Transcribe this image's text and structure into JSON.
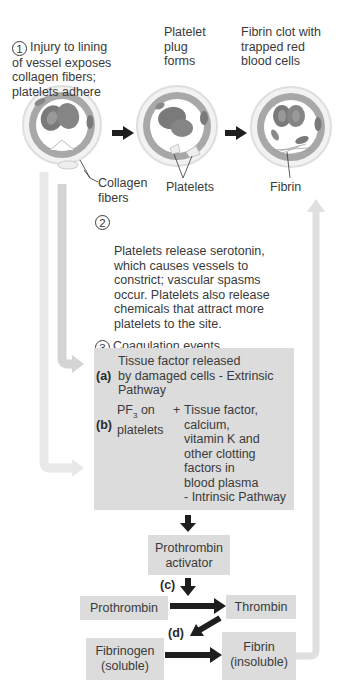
{
  "steps": {
    "step1": {
      "number": "1",
      "text": "Injury to lining\nof vessel exposes\ncollagen fibers;\nplatelets adhere"
    },
    "step1b": {
      "text": "Platelet\nplug\nforms"
    },
    "step1c": {
      "text": "Fibrin clot with\ntrapped red\nblood cells"
    },
    "step2": {
      "number": "2",
      "text": "Platelets release serotonin,\nwhich causes vessels to\nconstrict; vascular spasms\noccur. Platelets also release\nchemicals that attract more\nplatelets to the site."
    },
    "step3": {
      "number": "3",
      "text": "Coagulation events"
    }
  },
  "illustration_labels": {
    "collagen": "Collagen\nfibers",
    "platelets": "Platelets",
    "fibrin": "Fibrin"
  },
  "coagulation_box": {
    "a_label": "(a)",
    "a_text": "Tissue factor released\nby damaged cells - Extrinsic\nPathway",
    "b_label": "(b)",
    "b_pf": "PF",
    "b_pf_sub": "3",
    "b_on": " on",
    "b_platelets": "platelets",
    "b_plus": "+",
    "b_text": "Tissue factor,\ncalcium,\nvitamin K and\nother clotting\nfactors in\nblood plasma\n- Intrinsic Pathway"
  },
  "cascade": {
    "prothrombin_activator": "Prothrombin\nactivator",
    "c_label": "(c)",
    "prothrombin": "Prothrombin",
    "thrombin": "Thrombin",
    "d_label": "(d)",
    "fibrinogen": "Fibrinogen\n(soluble)",
    "fibrin": "Fibrin\n(insoluble)"
  },
  "colors": {
    "box_fill": "#dcdcdc",
    "pale_arrow": "#e6e6e6",
    "mid_arrow": "#d2d2d2",
    "black_arrow": "#1e1e1e",
    "text": "#3a3a3a"
  }
}
